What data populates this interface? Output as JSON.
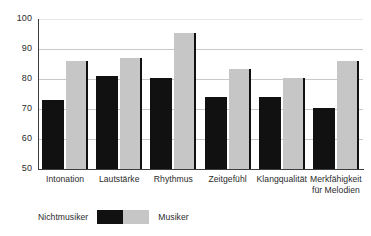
{
  "chart_data": {
    "type": "bar",
    "title": "",
    "subtitle": "",
    "xlabel": "",
    "ylabel": "",
    "ylim": [
      50,
      100
    ],
    "yticks": [
      50,
      60,
      70,
      80,
      90,
      100
    ],
    "grid": true,
    "legend_position": "bottom-left",
    "categories": [
      "Intonation",
      "Lautstärke",
      "Rhythmus",
      "Zeitgefühl",
      "Klangqualität",
      "Merkfähigkeit für Melodien"
    ],
    "series": [
      {
        "name": "Nichtmusiker",
        "color": "#111111",
        "values": [
          73,
          81,
          80.5,
          74,
          74,
          70.5
        ]
      },
      {
        "name": "Musiker",
        "color": "#c6c6c6",
        "values": [
          86,
          87,
          95.5,
          83.5,
          80.5,
          86
        ]
      }
    ]
  },
  "axis": {
    "y_tick_labels": [
      "100",
      "90",
      "80",
      "70",
      "60",
      "50"
    ]
  },
  "categories_display": [
    {
      "line1": "Intonation",
      "line2": ""
    },
    {
      "line1": "Lautstärke",
      "line2": ""
    },
    {
      "line1": "Rhythmus",
      "line2": ""
    },
    {
      "line1": "Zeitgefühl",
      "line2": ""
    },
    {
      "line1": "Klangqualität",
      "line2": ""
    },
    {
      "line1": "Merkfähigkeit",
      "line2": "für Melodien"
    }
  ],
  "legend": {
    "left_label": "Nichtmusiker",
    "right_label": "Musiker"
  },
  "colors": {
    "nichtmusiker": "#111111",
    "musiker": "#c6c6c6",
    "axis": "#3d3d3d",
    "grid": "#c9c9c9",
    "background": "#ffffff"
  }
}
